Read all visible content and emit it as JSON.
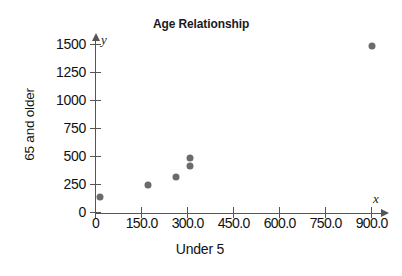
{
  "clipped_header_text": "",
  "axis_letters": {
    "x": "x",
    "y": "y"
  },
  "chart_data": {
    "type": "scatter",
    "title": "Age Relationship",
    "xlabel": "Under 5",
    "ylabel": "65 and older",
    "xlim": [
      0,
      930
    ],
    "ylim": [
      0,
      1560
    ],
    "grid": false,
    "legend": null,
    "xticks": [
      0,
      150,
      300,
      450,
      600,
      750,
      900
    ],
    "xticklabels": [
      "0",
      "150.0",
      "300.0",
      "450.0",
      "600.0",
      "750.0",
      "900.0"
    ],
    "yticks": [
      0,
      250,
      500,
      750,
      1000,
      1250,
      1500
    ],
    "yticklabels": [
      "0",
      "250",
      "500",
      "750",
      "1000",
      "1250",
      "1500"
    ],
    "marker_color": "#6b6b6b",
    "axis_color": "#555555",
    "points": [
      {
        "x": 13,
        "y": 135
      },
      {
        "x": 170,
        "y": 250
      },
      {
        "x": 262,
        "y": 320
      },
      {
        "x": 306,
        "y": 420
      },
      {
        "x": 306,
        "y": 490
      },
      {
        "x": 900,
        "y": 1490
      }
    ]
  }
}
